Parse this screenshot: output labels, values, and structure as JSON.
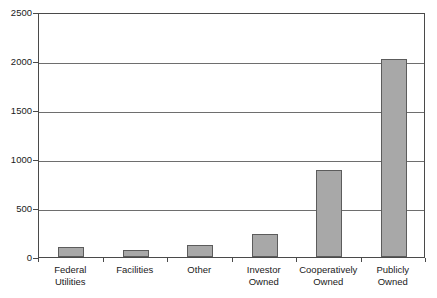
{
  "chart_data": {
    "type": "bar",
    "title": "",
    "subtitle": "",
    "xlabel": "",
    "ylabel": "",
    "categories": [
      "Federal Utilities",
      "Facilities",
      "Other",
      "Investor Owned",
      "Cooperatively Owned",
      "Publicly Owned"
    ],
    "category_lines": [
      [
        "Federal",
        "Utilities"
      ],
      [
        "Facilities",
        ""
      ],
      [
        "Other",
        ""
      ],
      [
        "Investor",
        "Owned"
      ],
      [
        "Cooperatively",
        "Owned"
      ],
      [
        "Publicly",
        "Owned"
      ]
    ],
    "values": [
      100,
      70,
      125,
      230,
      890,
      2020
    ],
    "ylim": [
      0,
      2500
    ],
    "yticks": [
      0,
      500,
      1000,
      1500,
      2000,
      2500
    ],
    "ytick_labels": [
      "0",
      "500",
      "1000",
      "1500",
      "2000",
      "2500"
    ],
    "grid": true,
    "grid_axis": "y",
    "legend": false,
    "legend_position": "none",
    "colors": {
      "bar_fill": "#a8a8a8",
      "bar_stroke": "#5c5c5c",
      "gridline": "#6e6e6e",
      "axis": "#4a4a4a",
      "background": "#ffffff",
      "text": "#1a1a1a"
    }
  }
}
